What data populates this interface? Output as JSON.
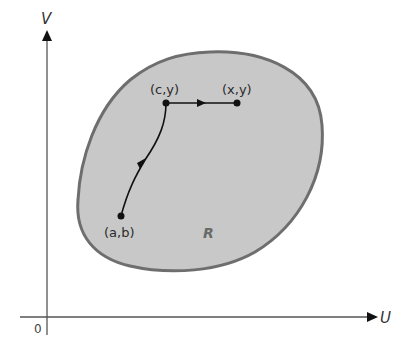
{
  "diagram": {
    "axes": {
      "vertical_label": "V",
      "horizontal_label": "U",
      "origin_label": "0"
    },
    "region": {
      "label": "R",
      "fill_color": "#c8c8c8",
      "stroke_color": "#6e6e6e"
    },
    "points": [
      {
        "id": "start",
        "label": "(a,b)"
      },
      {
        "id": "corner",
        "label": "(c,y)"
      },
      {
        "id": "end",
        "label": "(x,y)"
      }
    ],
    "paths": [
      {
        "from": "(a,b)",
        "to": "(c,y)",
        "type": "curve",
        "direction": "arrow toward (c,y)"
      },
      {
        "from": "(c,y)",
        "to": "(x,y)",
        "type": "horizontal segment",
        "direction": "arrow toward (x,y)"
      }
    ]
  }
}
